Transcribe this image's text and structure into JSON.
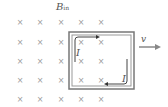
{
  "field": {
    "label": "B",
    "subscript": "in",
    "symbol": "cross",
    "rows": 5,
    "cols": 5
  },
  "velocity": {
    "label": "v"
  },
  "loop": {
    "current_label_left": "I",
    "current_label_right": "I"
  },
  "colors": {
    "crosses": "#9a9a9a",
    "loop": "#666666",
    "arrows": "#444444"
  }
}
